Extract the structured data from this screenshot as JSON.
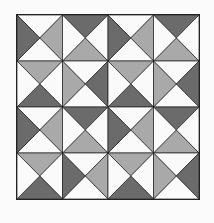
{
  "figure": {
    "type": "quilt-block-pattern",
    "grid": {
      "rows": 4,
      "cols": 4
    },
    "colors": {
      "white": "#fafafa",
      "medium": "#a9a9a9",
      "dark": "#6b6b6b",
      "line": "#222222"
    },
    "cells": [
      [
        {
          "top": "white",
          "right": "medium",
          "bottom": "white",
          "left": "dark"
        },
        {
          "top": "dark",
          "right": "white",
          "bottom": "medium",
          "left": "white"
        },
        {
          "top": "white",
          "right": "medium",
          "bottom": "white",
          "left": "dark"
        },
        {
          "top": "dark",
          "right": "white",
          "bottom": "medium",
          "left": "white"
        }
      ],
      [
        {
          "top": "medium",
          "right": "white",
          "bottom": "dark",
          "left": "white"
        },
        {
          "top": "white",
          "right": "dark",
          "bottom": "white",
          "left": "medium"
        },
        {
          "top": "medium",
          "right": "white",
          "bottom": "dark",
          "left": "white"
        },
        {
          "top": "white",
          "right": "dark",
          "bottom": "white",
          "left": "medium"
        }
      ],
      [
        {
          "top": "white",
          "right": "medium",
          "bottom": "white",
          "left": "dark"
        },
        {
          "top": "dark",
          "right": "white",
          "bottom": "medium",
          "left": "white"
        },
        {
          "top": "white",
          "right": "medium",
          "bottom": "white",
          "left": "dark"
        },
        {
          "top": "dark",
          "right": "white",
          "bottom": "medium",
          "left": "white"
        }
      ],
      [
        {
          "top": "medium",
          "right": "white",
          "bottom": "dark",
          "left": "white"
        },
        {
          "top": "white",
          "right": "medium",
          "bottom": "white",
          "left": "dark"
        },
        {
          "top": "medium",
          "right": "white",
          "bottom": "dark",
          "left": "white"
        },
        {
          "top": "white",
          "right": "dark",
          "bottom": "white",
          "left": "medium"
        }
      ]
    ]
  }
}
